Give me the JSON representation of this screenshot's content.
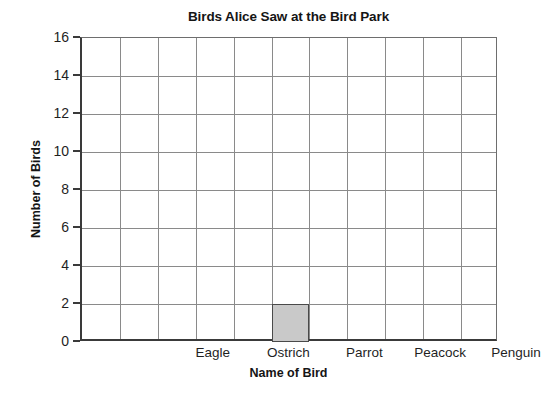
{
  "chart_data": {
    "type": "bar",
    "title": "Birds Alice Saw at the Bird Park",
    "xlabel": "Name of Bird",
    "ylabel": "Number of Birds",
    "categories": [
      "Eagle",
      "Ostrich",
      "Parrot",
      "Peacock",
      "Penguin"
    ],
    "values": [
      0,
      2,
      0,
      0,
      0
    ],
    "ylim": [
      0,
      16
    ],
    "ytick_labels": [
      "0",
      "2",
      "4",
      "6",
      "8",
      "10",
      "12",
      "14",
      "16"
    ],
    "ytick_values": [
      0,
      2,
      4,
      6,
      8,
      10,
      12,
      14,
      16
    ],
    "grid": true,
    "legend": "none",
    "bar_fill_color": "#c9c9c9",
    "bar_edge_color": "#4a4a4a",
    "axis_color": "#3a3a3a",
    "grid_color": "#8a8a8a",
    "background_color": "#ffffff"
  }
}
